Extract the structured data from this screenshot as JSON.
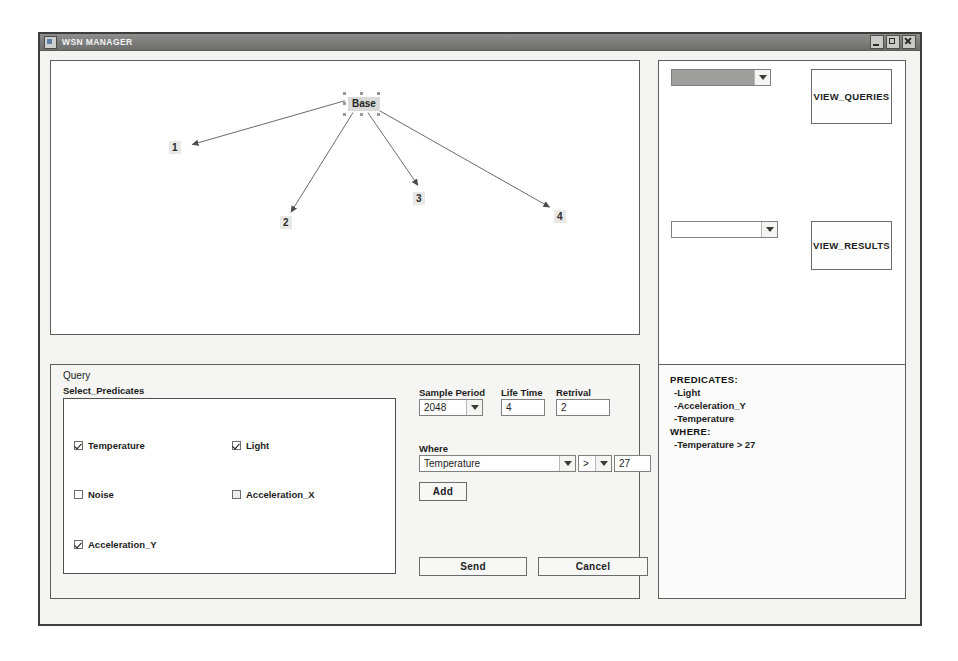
{
  "window": {
    "title": "WSN MANAGER",
    "icon": "app-icon",
    "controls": {
      "minimize": "minimize-icon",
      "maximize": "maximize-icon",
      "close": "close-icon"
    }
  },
  "topology": {
    "base_label": "Base",
    "nodes": [
      {
        "label": "1"
      },
      {
        "label": "2"
      },
      {
        "label": "3"
      },
      {
        "label": "4"
      }
    ],
    "back_button": "Back to networks list"
  },
  "side_panel": {
    "queries_combo_value": "",
    "view_queries_button": "VIEW_QUERIES",
    "results_combo_value": "",
    "view_results_button": "VIEW_RESULTS"
  },
  "query": {
    "group_title": "Query",
    "select_predicates_title": "Select_Predicates",
    "checkboxes": [
      {
        "label": "Temperature",
        "checked": true
      },
      {
        "label": "Light",
        "checked": true
      },
      {
        "label": "Noise",
        "checked": false
      },
      {
        "label": "Acceleration_X",
        "checked": false
      },
      {
        "label": "Acceleration_Y",
        "checked": true
      }
    ],
    "sample_period_label": "Sample Period",
    "sample_period_value": "2048",
    "life_time_label": "Life Time",
    "life_time_value": "4",
    "retrival_label": "Retrival",
    "retrival_value": "2",
    "where_label": "Where",
    "where_field_value": "Temperature",
    "where_operator_value": ">",
    "where_value": "27",
    "add_button": "Add",
    "send_button": "Send",
    "cancel_button": "Cancel"
  },
  "predicates_summary": {
    "predicates_header": "PREDICATES:",
    "predicates": [
      "-Light",
      "-Acceleration_Y",
      "-Temperature"
    ],
    "where_header": "WHERE:",
    "where_items": [
      "-Temperature > 27"
    ]
  },
  "colors": {
    "titlebar": "#7b7b79",
    "window_border": "#3d3d3d",
    "panel_bg": "#ffffff",
    "client_bg": "#f3f3f2"
  }
}
